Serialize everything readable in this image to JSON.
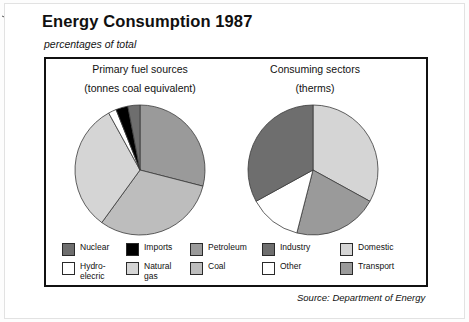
{
  "header": {
    "title": "Energy Consumption 1987",
    "subtitle": "percentages of total"
  },
  "footer": {
    "source": "Source: Department of Energy"
  },
  "annotation": {
    "line1": "converted into",
    "line2": "secondary fuels"
  },
  "left_chart": {
    "title": "Primary fuel sources",
    "subtitle": "(tonnes coal equivalent)",
    "legend": [
      {
        "label": "Nuclear",
        "color": "#6e6e6e"
      },
      {
        "label": "Imports",
        "color": "#000000"
      },
      {
        "label": "Petroleum",
        "color": "#9a9a9a"
      },
      {
        "label": "Hydro-\nelecric",
        "color": "#ffffff"
      },
      {
        "label": "Natural\ngas",
        "color": "#d5d5d5"
      },
      {
        "label": "Coal",
        "color": "#bdbdbd"
      }
    ]
  },
  "right_chart": {
    "title": "Consuming sectors",
    "subtitle": "(therms)",
    "legend": [
      {
        "label": "Industry",
        "color": "#6e6e6e"
      },
      {
        "label": "Domestic",
        "color": "#d5d5d5"
      },
      {
        "label": "Other",
        "color": "#ffffff"
      },
      {
        "label": "Transport",
        "color": "#9a9a9a"
      }
    ]
  },
  "chart_data": [
    {
      "type": "pie",
      "title": "Primary fuel sources",
      "subtitle": "(tonnes coal equivalent)",
      "unit": "percentages of total",
      "categories": [
        "Petroleum",
        "Coal",
        "Natural gas",
        "Hydro-elecric",
        "Imports",
        "Nuclear"
      ],
      "values": [
        29,
        31,
        32,
        2,
        3,
        3
      ],
      "colors": [
        "#9a9a9a",
        "#bdbdbd",
        "#d5d5d5",
        "#ffffff",
        "#000000",
        "#6e6e6e"
      ],
      "start_angle_deg": 0,
      "direction": "clockwise",
      "annotation": "converted into secondary fuels",
      "legend_position": "bottom"
    },
    {
      "type": "pie",
      "title": "Consuming sectors",
      "subtitle": "(therms)",
      "unit": "percentages of total",
      "categories": [
        "Domestic",
        "Transport",
        "Other",
        "Industry"
      ],
      "values": [
        33,
        21,
        13,
        33
      ],
      "colors": [
        "#d5d5d5",
        "#9a9a9a",
        "#ffffff",
        "#6e6e6e"
      ],
      "start_angle_deg": 0,
      "direction": "clockwise",
      "legend_position": "bottom"
    }
  ]
}
